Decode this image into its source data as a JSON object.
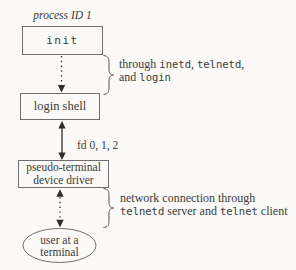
{
  "diagram": {
    "process_label": "process ID 1",
    "init_label": "init",
    "login_shell_label": "login shell",
    "fd_label": "fd 0, 1, 2",
    "pty_box": {
      "line1": "pseudo-terminal",
      "line2": "device driver"
    },
    "terminal_ellipse": {
      "line1": "user at a",
      "line2": "terminal"
    },
    "annotation_top": {
      "line1": {
        "seg1": "through ",
        "code1": "inetd",
        "seg2": ", ",
        "code2": "telnetd",
        "seg3": ","
      },
      "line2": {
        "seg1": "and ",
        "code1": "login"
      }
    },
    "annotation_bottom": {
      "line1": {
        "seg1": "network connection through"
      },
      "line2": {
        "code1": "telnetd",
        "seg1": " server and ",
        "code2": "telnet",
        "seg2": " client"
      }
    },
    "colors": {
      "ink": "#3a3a3a",
      "box_border": "#6e6e6e",
      "connector": "#2f2f2f",
      "background": "#fbfaf8"
    }
  }
}
